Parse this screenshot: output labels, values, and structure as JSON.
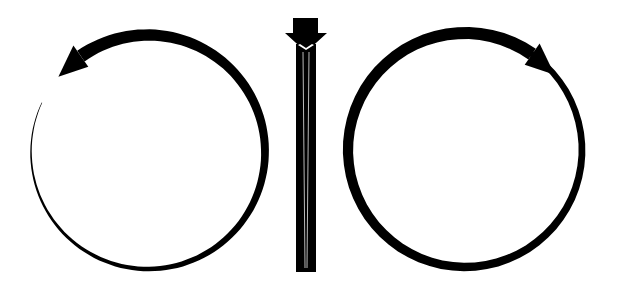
{
  "diagram": {
    "colors": {
      "stroke": "#000000",
      "background": "#ffffff",
      "highlight": "#ffffff"
    },
    "left_rotation": {
      "direction": "counterclockwise",
      "center": [
        148,
        152
      ],
      "radius": 117,
      "arrow_head": "top-left"
    },
    "center_arrow": {
      "direction": "down",
      "shaft_x": [
        297,
        315
      ],
      "top": 18,
      "bottom": 272
    },
    "right_rotation": {
      "direction": "clockwise",
      "center": [
        465,
        150
      ],
      "radius": 117,
      "arrow_head": "top-right"
    }
  }
}
